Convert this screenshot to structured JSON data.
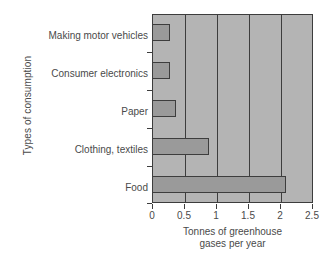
{
  "chart_data": {
    "type": "bar",
    "orientation": "horizontal",
    "title": "",
    "xlabel_line1": "Tonnes of greenhouse",
    "xlabel_line2": "gases per year",
    "ylabel": "Types of consumption",
    "categories": [
      "Making motor vehicles",
      "Consumer electronics",
      "Paper",
      "Clothing, textiles",
      "Food"
    ],
    "values": [
      0.29,
      0.29,
      0.37,
      0.9,
      2.1
    ],
    "xlim": [
      0,
      2.5
    ],
    "xticks": [
      "0",
      "0.5",
      "1",
      "1.5",
      "2",
      "2.5"
    ],
    "xtick_values": [
      0,
      0.5,
      1,
      1.5,
      2,
      2.5
    ],
    "gridlines_x": [
      0.5,
      1,
      1.5,
      2
    ],
    "grid": true,
    "legend": "none",
    "colors": {
      "bar_fill": "#9a9a9a",
      "bar_edge": "#3d3d3d",
      "plot_background": "#b4b4b4",
      "figure_background": "#ffffff",
      "text": "#4a4a4a"
    }
  }
}
